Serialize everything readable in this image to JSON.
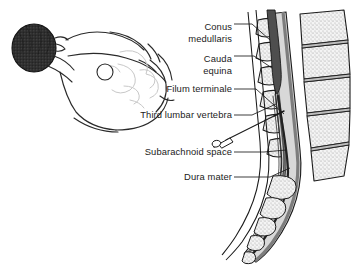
{
  "figure": {
    "kind": "medical-illustration",
    "background_color": "#ffffff",
    "ink_color": "#1b1b1b"
  },
  "labels": [
    {
      "id": "conus-medullaris",
      "line1": "Conus",
      "line2": "medullaris",
      "x": 232,
      "y1": 27,
      "y2": 39
    },
    {
      "id": "cauda-equina",
      "line1": "Cauda",
      "line2": "equina",
      "x": 232,
      "y1": 59,
      "y2": 71
    },
    {
      "id": "filum-terminale",
      "line1": "Filum terminale",
      "line2": "",
      "x": 232,
      "y1": 92,
      "y2": 0
    },
    {
      "id": "third-lumbar-vertebra",
      "line1": "Third lumbar vertebra",
      "line2": "",
      "x": 232,
      "y1": 118,
      "y2": 0
    },
    {
      "id": "subarachnoid-space",
      "line1": "Subarachnoid space",
      "line2": "",
      "x": 232,
      "y1": 155,
      "y2": 0
    },
    {
      "id": "dura-mater",
      "line1": "Dura mater",
      "line2": "",
      "x": 232,
      "y1": 180,
      "y2": 0
    }
  ],
  "leaders": [
    {
      "id": "leader-conus",
      "d": "M234,24 L250,24 L268,40"
    },
    {
      "id": "leader-cauda",
      "d": "M234,56 L252,56 L270,66"
    },
    {
      "id": "leader-filum",
      "d": "M234,89 L254,89 L282,112"
    },
    {
      "id": "leader-l3",
      "d": "M234,115 L250,115 L274,104"
    },
    {
      "id": "leader-subarach",
      "d": "M234,152 L262,152 L284,150"
    },
    {
      "id": "leader-dura",
      "d": "M234,177 L268,177 L288,170"
    }
  ],
  "colors": {
    "bone_fill": "#f2f2f2",
    "bone_stipple": "#9a9a9a",
    "disc_gray": "#b9b9b9",
    "dura_gray": "#8f8f8f",
    "cord_dark": "#4a4a4a",
    "canal_mid": "#d6d6d6",
    "outline": "#1b1b1b",
    "hair_dark": "#2b2b2b",
    "body_outline": "#2a2a2a",
    "body_faint": "#c8c8c8"
  },
  "body_figure": {
    "id": "patient-lateral-flexed",
    "description": "Patient lying on side in flexed (fetal) position",
    "puncture_site_marker": {
      "cx": 105,
      "cy": 72,
      "r": 8
    }
  },
  "needle": {
    "id": "spinal-needle",
    "description": "Spinal needle with hub inserted between vertebrae",
    "shaft": "M213,141 L262,119",
    "tip": "M262,119 L278,112"
  }
}
